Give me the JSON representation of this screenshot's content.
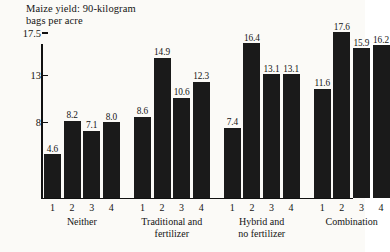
{
  "chart_data": {
    "type": "bar",
    "title": "Maize yield: 90-kilogram\nbags per acre",
    "title_line1": "Maize yield: 90-kilogram",
    "title_line2": "bags per acre",
    "xlabel": "",
    "ylabel": "Maize yield: 90-kilogram bags per acre",
    "ylim": [
      0,
      18.6
    ],
    "grid": false,
    "legend": "none",
    "bar_color": "#1a1a1a",
    "background_color": "#fbfaf7",
    "axis_color": "#111111",
    "y_ticks": [
      {
        "value": 8,
        "label": "8"
      },
      {
        "value": 13,
        "label": "13"
      },
      {
        "value": 17.5,
        "label": "17.5"
      }
    ],
    "categories": [
      "1",
      "2",
      "3",
      "4"
    ],
    "groups": [
      {
        "name": "Neither",
        "label_line1": "Neither",
        "label_line2": "",
        "categories": [
          "1",
          "2",
          "3",
          "4"
        ],
        "values": [
          4.6,
          8.2,
          7.1,
          8.0
        ],
        "value_labels": [
          "4.6",
          "8.2",
          "7.1",
          "8.0"
        ]
      },
      {
        "name": "Traditional and fertilizer",
        "label_line1": "Traditional and",
        "label_line2": "fertilizer",
        "categories": [
          "1",
          "2",
          "3",
          "4"
        ],
        "values": [
          8.6,
          14.9,
          10.6,
          12.3
        ],
        "value_labels": [
          "8.6",
          "14.9",
          "10.6",
          "12.3"
        ]
      },
      {
        "name": "Hybrid and no fertilizer",
        "label_line1": "Hybrid and",
        "label_line2": "no fertilizer",
        "categories": [
          "1",
          "2",
          "3",
          "4"
        ],
        "values": [
          7.4,
          16.4,
          13.1,
          13.1
        ],
        "value_labels": [
          "7.4",
          "16.4",
          "13.1",
          "13.1"
        ]
      },
      {
        "name": "Combination",
        "label_line1": "Combination",
        "label_line2": "",
        "categories": [
          "1",
          "2",
          "3",
          "4"
        ],
        "values": [
          11.6,
          17.6,
          15.9,
          16.2
        ],
        "value_labels": [
          "11.6",
          "17.6",
          "15.9",
          "16.2"
        ]
      }
    ]
  },
  "layout": {
    "plot_left": 41,
    "plot_baseline_y": 197.6,
    "plot_top_y": 44,
    "px_per_unit": 9.4,
    "bar_width": 17,
    "bar_gap": 2.6,
    "group_gap": 11.5,
    "first_bar_x": 44
  }
}
